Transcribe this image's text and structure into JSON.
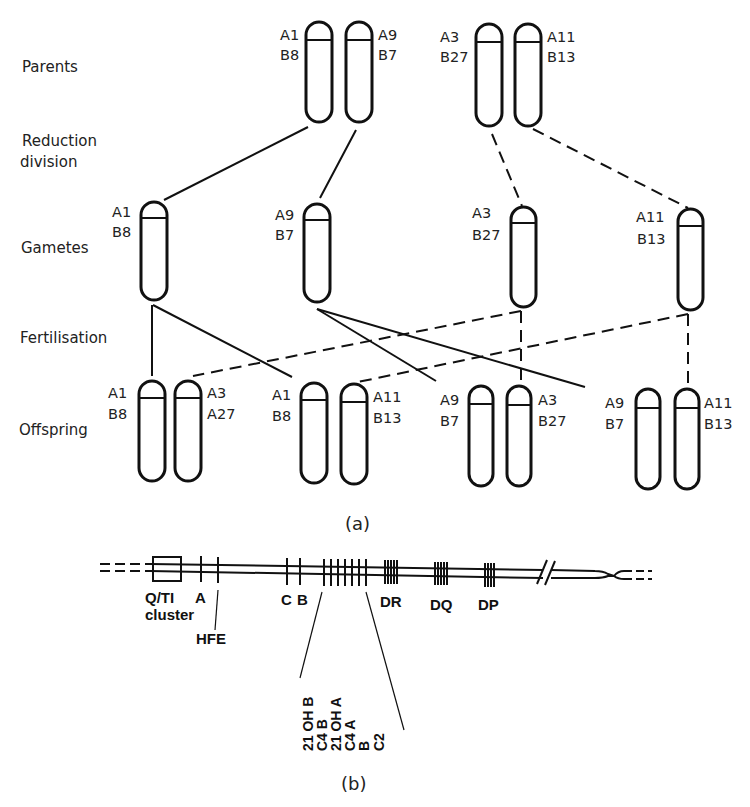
{
  "figure_a": {
    "caption": "(a)",
    "stages": {
      "parents": "Parents",
      "reduction_line1": "Reduction",
      "reduction_line2": "division",
      "gametes": "Gametes",
      "fertilisation": "Fertilisation",
      "offspring": "Offspring"
    },
    "parents": [
      {
        "a": "A1",
        "b": "B8"
      },
      {
        "a": "A9",
        "b": "B7"
      },
      {
        "a": "A3",
        "b": "B27"
      },
      {
        "a": "A11",
        "b": "B13"
      }
    ],
    "gametes": [
      {
        "a": "A1",
        "b": "B8"
      },
      {
        "a": "A9",
        "b": "B7"
      },
      {
        "a": "A3",
        "b": "B27"
      },
      {
        "a": "A11",
        "b": "B13"
      }
    ],
    "offspring": [
      {
        "left": {
          "a": "A1",
          "b": "B8"
        },
        "right": {
          "a": "A3",
          "b": "A27"
        }
      },
      {
        "left": {
          "a": "A1",
          "b": "B8"
        },
        "right": {
          "a": "A11",
          "b": "B13"
        }
      },
      {
        "left": {
          "a": "A9",
          "b": "B7"
        },
        "right": {
          "a": "A3",
          "b": "B27"
        }
      },
      {
        "left": {
          "a": "A9",
          "b": "B7"
        },
        "right": {
          "a": "A11",
          "b": "B13"
        }
      }
    ]
  },
  "figure_b": {
    "caption": "(b)",
    "genes": {
      "qti_line1": "Q/TI",
      "a": "A",
      "qti_line2": "cluster",
      "hfe": "HFE",
      "c": "C",
      "b": "B",
      "dr": "DR",
      "dq": "DQ",
      "dp": "DP"
    },
    "class3_genes": [
      "21 OH B",
      "C4 B",
      "21 OH A",
      "C4 A",
      "B",
      "C2"
    ]
  }
}
